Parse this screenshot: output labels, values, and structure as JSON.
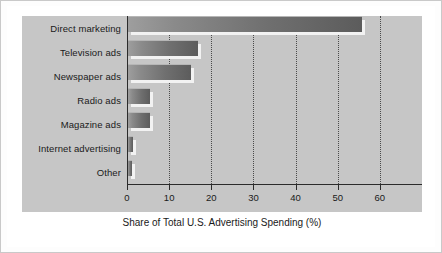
{
  "chart_data": {
    "type": "bar",
    "orientation": "horizontal",
    "title": "",
    "subtitle": "",
    "xlabel": "Share of Total U.S. Advertising Spending (%)",
    "ylabel": "",
    "categories": [
      "Direct marketing",
      "Television ads",
      "Newspaper ads",
      "Radio ads",
      "Magazine ads",
      "Internet advertising",
      "Other"
    ],
    "values": [
      55.5,
      16.5,
      15.0,
      5.2,
      5.2,
      1.2,
      1.0
    ],
    "xlim": [
      0,
      70
    ],
    "xticks": [
      0,
      10,
      20,
      30,
      40,
      50,
      60
    ],
    "xticklabels": [
      "0",
      "10",
      "20",
      "30",
      "40",
      "50",
      "60"
    ],
    "grid": "vertical-dotted",
    "legend": "none",
    "annotations": [],
    "colors": {
      "panel_background": "#c6c6c6",
      "figure_background": "#ffffff",
      "bar_light": "#9e9e9e",
      "bar_dark": "#5c5c5c",
      "bar_shadow": "#f2f2f2",
      "axis": "#2b2b2b",
      "gridline": "#4a4a4a",
      "text": "#1a1a1a",
      "frame_border": "#c9c9c9"
    }
  }
}
